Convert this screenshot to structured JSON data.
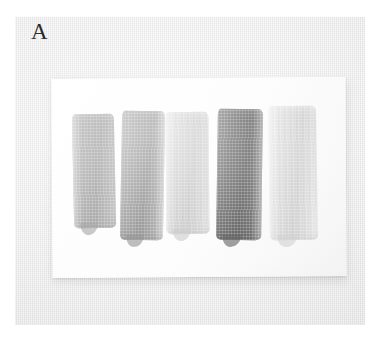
{
  "figure": {
    "panel_label": "A",
    "caption_visible": false,
    "background_color": "#ebebeb",
    "paper_color": "#fdfdfd",
    "label_color": "#2b2b2b"
  },
  "photo": {
    "name": "paint-swatch-photograph",
    "backdrop_color": "#ebebeb",
    "paper": {
      "name": "white-paper-card",
      "color": "#fdfdfd",
      "x": 37,
      "y": 61,
      "width": 294,
      "height": 199
    }
  },
  "swatches": [
    {
      "index": 1,
      "name": "swatch-1",
      "tone_label": "medium gray",
      "color": "#9c9c9c",
      "color_light": "#b2b2b2",
      "color_dark": "#8d8d8d",
      "x": 73,
      "y": 114,
      "width": 42,
      "height": 114
    },
    {
      "index": 2,
      "name": "swatch-2",
      "tone_label": "medium-dark gray",
      "color": "#8c8c8c",
      "color_light": "#a6a6a6",
      "color_dark": "#747474",
      "x": 121,
      "y": 111,
      "width": 43,
      "height": 129
    },
    {
      "index": 3,
      "name": "swatch-3",
      "tone_label": "light gray",
      "color": "#c9c9c9",
      "color_light": "#dcdcdc",
      "color_dark": "#bcbcbc",
      "x": 166,
      "y": 112,
      "width": 43,
      "height": 122
    },
    {
      "index": 4,
      "name": "swatch-4",
      "tone_label": "dark charcoal gray",
      "color": "#4c4c4c",
      "color_light": "#6a6a6a",
      "color_dark": "#3a3a3a",
      "x": 217,
      "y": 109,
      "width": 45,
      "height": 131
    },
    {
      "index": 5,
      "name": "swatch-5",
      "tone_label": "very light gray",
      "color": "#d8d8d8",
      "color_light": "#e9e9e9",
      "color_dark": "#cacaca",
      "x": 269,
      "y": 106,
      "width": 48,
      "height": 134
    }
  ]
}
